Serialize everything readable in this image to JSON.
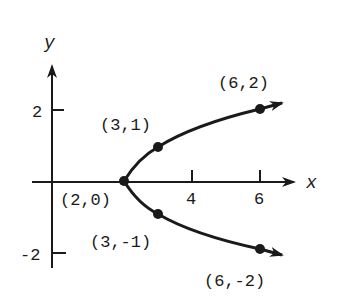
{
  "axes": {
    "x_label": "x",
    "y_label": "y",
    "x_ticks": [
      {
        "value": 4,
        "label": "4"
      },
      {
        "value": 6,
        "label": "6"
      }
    ],
    "y_ticks": [
      {
        "value": 2,
        "label": "2"
      },
      {
        "value": -2,
        "label": "-2"
      }
    ]
  },
  "points": [
    {
      "label": "(2,0)",
      "x": 2,
      "y": 0
    },
    {
      "label": "(3,1)",
      "x": 3,
      "y": 1
    },
    {
      "label": "(3,-1)",
      "x": 3,
      "y": -1
    },
    {
      "label": "(6,2)",
      "x": 6,
      "y": 2
    },
    {
      "label": "(6,-2)",
      "x": 6,
      "y": -2
    }
  ],
  "curve": {
    "equation": "x = y^2 + 2",
    "type": "parabola opening right"
  },
  "colors": {
    "ink": "#1a1a1a",
    "background": "#ffffff"
  }
}
